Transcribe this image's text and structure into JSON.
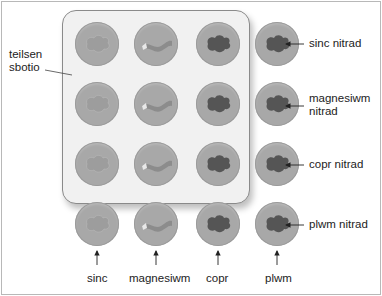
{
  "diagram": {
    "tray_label": "teilsen sbotio",
    "tray_label_lines": [
      "teilsen",
      "sbotio"
    ],
    "row_labels": [
      {
        "lines": [
          "sinc nitrad"
        ]
      },
      {
        "lines": [
          "magnesiwm",
          "nitrad"
        ]
      },
      {
        "lines": [
          "copr nitrad"
        ]
      },
      {
        "lines": [
          "plwm nitrad"
        ]
      }
    ],
    "column_labels": [
      "sinc",
      "magnesiwm",
      "copr",
      "plwm"
    ],
    "columns": [
      {
        "metal": "sinc",
        "sample_shape": "faint-blob"
      },
      {
        "metal": "magnesiwm",
        "sample_shape": "ribbon"
      },
      {
        "metal": "copr",
        "sample_shape": "dark-blob"
      },
      {
        "metal": "plwm",
        "sample_shape": "dark-blob"
      }
    ],
    "colors": {
      "tray": "#f1f1f1",
      "well": "#a8a8a8",
      "dark_blob": "#555555",
      "faint_blob": "#9d9d9d",
      "ribbon": "#8c8c8c"
    }
  }
}
